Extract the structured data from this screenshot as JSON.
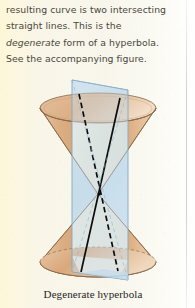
{
  "page": {
    "background_color": "#f8f5e6",
    "gutter_color": "#fefefe"
  },
  "body_text": {
    "line1": "resulting curve is two intersecting",
    "line2": "straight lines. This is the",
    "line3_italic": "degenerate",
    "line3_rest": " form of a hyperbola.",
    "line4": "See the accompanying figure.",
    "text_color": "#4a463c"
  },
  "figure": {
    "name": "double-cone-with-vertical-cutting-plane",
    "cone_fill_color": "#d9a878",
    "cone_fill_light": "#efd3b3",
    "cone_outline_color": "#8a6a4a",
    "plane_fill_color": "#bfd9ea",
    "plane_edge_color": "#7fa8c4",
    "intersection_line_color": "#101010",
    "cut_face_color": "#f2efe2",
    "parts": {
      "upper_cone": "upper nappe, opens upward",
      "lower_cone": "lower nappe, opens downward",
      "apex": "common vertex of the two nappes",
      "plane": "vertical plane through the apex",
      "solid_line": "front intersection line",
      "dashed_line": "rear intersection line (hidden)"
    }
  },
  "caption": {
    "text": "Degenerate hyperbola",
    "color": "#242424"
  }
}
